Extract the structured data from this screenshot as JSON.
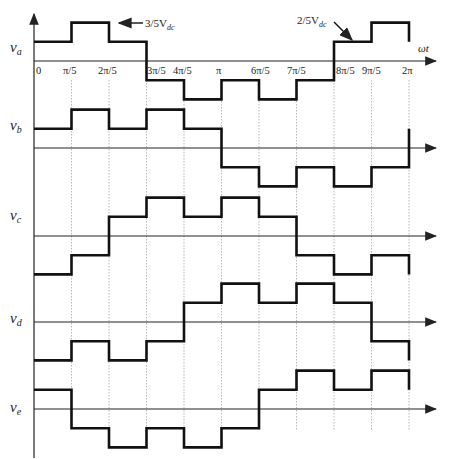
{
  "diagram": {
    "x_axis_label": "ωt",
    "tick_labels": [
      "0",
      "π/5",
      "2π/5",
      "3π/5",
      "4π/5",
      "π",
      "6π/5",
      "7π/5",
      "8π/5",
      "9π/5",
      "2π"
    ],
    "annotations": [
      {
        "text": "3/5V",
        "sub": "dc",
        "points_to": "va outer level"
      },
      {
        "text": "2/5V",
        "sub": "dc",
        "points_to": "va inner level"
      }
    ],
    "level_meaning": {
      "1": "2/5 Vdc",
      "2": "3/5 Vdc",
      "-1": "-2/5 Vdc",
      "-2": "-3/5 Vdc"
    },
    "waveforms": [
      {
        "name": "v",
        "sub": "a",
        "levels": [
          1,
          2,
          1,
          -1,
          -2,
          -1,
          -2,
          -1,
          1,
          2
        ]
      },
      {
        "name": "v",
        "sub": "b",
        "levels": [
          1,
          2,
          1,
          2,
          1,
          -1,
          -2,
          -1,
          -2,
          -1
        ]
      },
      {
        "name": "v",
        "sub": "c",
        "levels": [
          -2,
          -1,
          1,
          2,
          1,
          2,
          1,
          -1,
          -2,
          -1
        ]
      },
      {
        "name": "v",
        "sub": "d",
        "levels": [
          -2,
          -1,
          -2,
          -1,
          1,
          2,
          1,
          2,
          1,
          -1
        ]
      },
      {
        "name": "v",
        "sub": "e",
        "levels": [
          1,
          -1,
          -2,
          -1,
          -2,
          -1,
          1,
          2,
          1,
          2
        ]
      }
    ]
  },
  "labels": {
    "va": "v",
    "va_sub": "a",
    "vb": "v",
    "vb_sub": "b",
    "vc": "v",
    "vc_sub": "c",
    "vd": "v",
    "vd_sub": "d",
    "ve": "v",
    "ve_sub": "e",
    "omega_t": "ωt",
    "ann1": "3/5V",
    "ann1_sub": "dc",
    "ann2": "2/5V",
    "ann2_sub": "dc",
    "t0": "0",
    "t1": "π/5",
    "t2": "2π/5",
    "t3": "3π/5",
    "t4": "4π/5",
    "t5": "π",
    "t6": "6π/5",
    "t7": "7π/5",
    "t8": "8π/5",
    "t9": "9π/5",
    "t10": "2π"
  }
}
